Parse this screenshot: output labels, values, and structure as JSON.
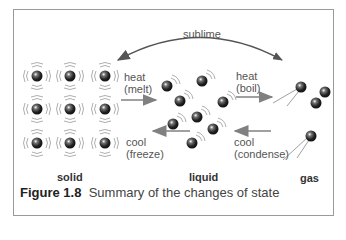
{
  "figure": {
    "caption_number": "Figure 1.8",
    "caption_text": "Summary of the changes of state"
  },
  "states": {
    "solid": "solid",
    "liquid": "liquid",
    "gas": "gas"
  },
  "transitions": {
    "sublime": "sublime",
    "melt_line1": "heat",
    "melt_line2": "(melt)",
    "freeze_line1": "cool",
    "freeze_line2": "(freeze)",
    "boil_line1": "heat",
    "boil_line2": "(boil)",
    "condense_line1": "cool",
    "condense_line2": "(condense)"
  },
  "colors": {
    "particle": "#2b2b2b",
    "arrow": "#808080",
    "frame": "#9a9a9a"
  }
}
